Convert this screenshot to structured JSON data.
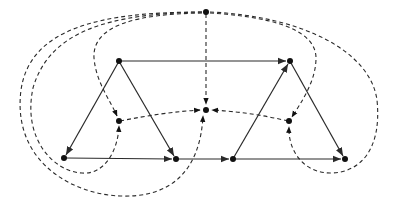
{
  "diagram": {
    "type": "plane-graph-with-dual",
    "colors": {
      "stroke": "#2a2a2a",
      "node": "#111111",
      "background": "#ffffff"
    },
    "primal": {
      "nodes": [
        {
          "id": "A",
          "x": 119,
          "y": 61
        },
        {
          "id": "B",
          "x": 290,
          "y": 61
        },
        {
          "id": "C",
          "x": 64,
          "y": 158
        },
        {
          "id": "D",
          "x": 176,
          "y": 159
        },
        {
          "id": "E",
          "x": 233,
          "y": 159
        },
        {
          "id": "F",
          "x": 345,
          "y": 159
        }
      ],
      "edges": [
        {
          "from": "A",
          "to": "B",
          "directed": true
        },
        {
          "from": "A",
          "to": "C",
          "directed": true
        },
        {
          "from": "A",
          "to": "D",
          "directed": true
        },
        {
          "from": "C",
          "to": "D",
          "directed": true
        },
        {
          "from": "D",
          "to": "E",
          "directed": true
        },
        {
          "from": "E",
          "to": "B",
          "directed": true
        },
        {
          "from": "B",
          "to": "F",
          "directed": true
        },
        {
          "from": "E",
          "to": "F",
          "directed": true
        }
      ]
    },
    "dual": {
      "style": "dashed",
      "nodes": [
        {
          "id": "T",
          "x": 206,
          "y": 12
        },
        {
          "id": "L",
          "x": 119,
          "y": 121
        },
        {
          "id": "M",
          "x": 206,
          "y": 110
        },
        {
          "id": "R",
          "x": 289,
          "y": 121
        }
      ],
      "edges": [
        {
          "from": "T",
          "to": "M",
          "label": "crosses A-B"
        },
        {
          "from": "L",
          "to": "M",
          "label": "crosses A-D"
        },
        {
          "from": "M",
          "to": "R",
          "label": "crosses E-B"
        },
        {
          "from": "T",
          "to": "L",
          "label": "crosses A-C (outer loop)"
        },
        {
          "from": "T",
          "to": "L",
          "label": "crosses C-D (outer loop)"
        },
        {
          "from": "T",
          "to": "M",
          "label": "crosses D-E (outer loop)"
        },
        {
          "from": "T",
          "to": "R",
          "label": "crosses B-F (outer loop)"
        },
        {
          "from": "T",
          "to": "R",
          "label": "crosses E-F (outer loop)"
        }
      ]
    }
  }
}
